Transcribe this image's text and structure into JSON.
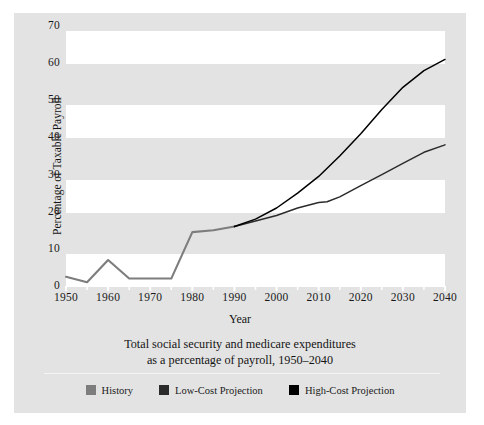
{
  "chart_data": {
    "type": "line",
    "title": "",
    "caption_line1": "Total social security and medicare expenditures",
    "caption_line2": "as a percentage of payroll, 1950–2040",
    "xlabel": "Year",
    "ylabel": "Percentage of Taxable Payroll",
    "xlim": [
      1950,
      2040
    ],
    "ylim": [
      0,
      70
    ],
    "xticks": [
      1950,
      1960,
      1970,
      1980,
      1990,
      2000,
      2010,
      2020,
      2030,
      2040
    ],
    "yticks": [
      0,
      10,
      20,
      30,
      40,
      50,
      60,
      70
    ],
    "grid": "horizontal-banding",
    "legend_position": "bottom-center",
    "series": [
      {
        "name": "History",
        "color": "#7d7d7d",
        "x": [
          1950,
          1955,
          1960,
          1965,
          1970,
          1975,
          1980,
          1985,
          1990
        ],
        "values": [
          2.5,
          1.0,
          7.0,
          2.0,
          2.0,
          2.0,
          14.5,
          15.0,
          16.0
        ]
      },
      {
        "name": "Low-Cost Projection",
        "color": "#2b2b2b",
        "x": [
          1990,
          1995,
          2000,
          2005,
          2010,
          2012,
          2015,
          2020,
          2025,
          2030,
          2035,
          2040
        ],
        "values": [
          16.0,
          17.5,
          19.0,
          21.0,
          22.5,
          22.7,
          24.0,
          27.0,
          30.0,
          33.0,
          36.0,
          38.0
        ]
      },
      {
        "name": "High-Cost Projection",
        "color": "#000000",
        "x": [
          1990,
          1995,
          2000,
          2005,
          2010,
          2015,
          2020,
          2025,
          2030,
          2035,
          2040
        ],
        "values": [
          16.0,
          18.0,
          21.0,
          25.0,
          29.5,
          35.0,
          41.0,
          47.5,
          53.5,
          58.0,
          61.0
        ]
      }
    ]
  },
  "axis": {
    "y_title": "Percentage of Taxable Payroll",
    "x_title": "Year",
    "y_tick_labels": [
      "70",
      "60",
      "50",
      "40",
      "30",
      "20",
      "10",
      "0"
    ],
    "x_tick_labels": [
      "1950",
      "1960",
      "1970",
      "1980",
      "1990",
      "2000",
      "2010",
      "2020",
      "2030",
      "2040"
    ]
  },
  "caption": {
    "line1": "Total social security and medicare expenditures",
    "line2": "as a percentage of payroll, 1950–2040"
  },
  "legend": {
    "items": [
      {
        "label": "History",
        "color": "#7d7d7d"
      },
      {
        "label": "Low-Cost Projection",
        "color": "#2b2b2b"
      },
      {
        "label": "High-Cost Projection",
        "color": "#000000"
      }
    ]
  },
  "colors": {
    "panel_background": "#e3e3e3",
    "band_white": "#ffffff",
    "text": "#1a1a1a",
    "history": "#7d7d7d",
    "low_cost": "#2b2b2b",
    "high_cost": "#000000"
  }
}
